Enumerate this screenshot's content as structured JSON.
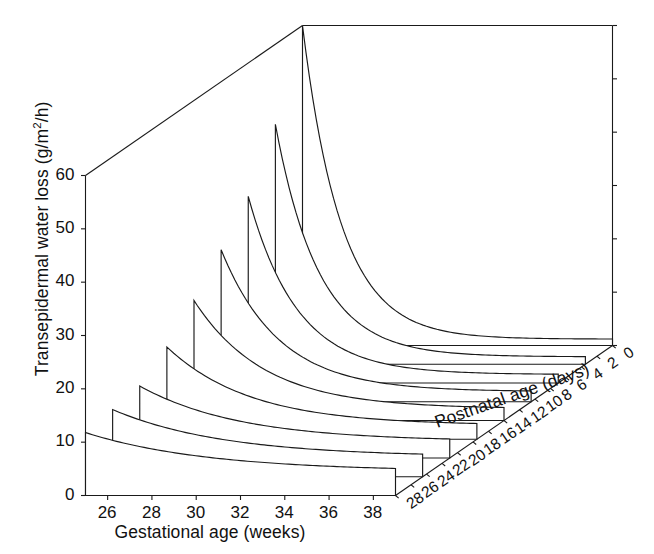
{
  "chart_data": {
    "type": "line",
    "subtype": "3d-waterfall-ridge",
    "title": "",
    "xlabel": "Gestational age (weeks)",
    "ylabel": "Transepidermal water loss (g/m2/h)",
    "zlabel": "Postnatal age (days)",
    "xlabel_display": "Gestational age (weeks)",
    "ylabel_display_pre": "Transepidermal water loss (g/m",
    "ylabel_display_sup": "2",
    "ylabel_display_post": "/h)",
    "zlabel_display": "Postnatal age (days)",
    "xticks": [
      26,
      28,
      30,
      32,
      34,
      36,
      38
    ],
    "xtick_labels": [
      "26",
      "28",
      "30",
      "32",
      "34",
      "36",
      "38"
    ],
    "yticks": [
      0,
      10,
      20,
      30,
      40,
      50,
      60
    ],
    "ytick_labels": [
      "0",
      "10",
      "20",
      "30",
      "40",
      "50",
      "60"
    ],
    "zticks": [
      28,
      26,
      24,
      22,
      20,
      18,
      16,
      14,
      12,
      10,
      8,
      6,
      4,
      2,
      0
    ],
    "ztick_labels": [
      "28",
      "26",
      "24",
      "22",
      "20",
      "18",
      "16",
      "14",
      "12",
      "10",
      "8",
      "6",
      "4",
      "2",
      "0"
    ],
    "xlim": [
      25,
      39
    ],
    "ylim": [
      0,
      60
    ],
    "zlim": [
      0,
      28
    ],
    "grid": false,
    "legend": false,
    "line_color": "#1a1a1a",
    "background_color": "#ffffff",
    "series": [
      {
        "name": "25 weeks",
        "gestational_age": 25,
        "peak_value": 11.8,
        "decay_days": 11.0,
        "asymptote": 4.5,
        "x_days": [
          0,
          2,
          4,
          6,
          8,
          10,
          12,
          14,
          16,
          18,
          20,
          22,
          24,
          26,
          28
        ],
        "values": [
          11.8,
          10.6,
          9.6,
          8.8,
          8.0,
          7.4,
          6.9,
          6.5,
          6.1,
          5.8,
          5.6,
          5.4,
          5.2,
          5.0,
          4.9
        ]
      },
      {
        "name": "27 weeks",
        "gestational_age": 27,
        "peak_value": 12.6,
        "decay_days": 10.0,
        "asymptote": 3.7,
        "x_days": [
          0,
          2,
          4,
          6,
          8,
          10,
          12,
          14,
          16,
          18,
          20,
          22,
          24,
          26,
          28
        ],
        "values": [
          12.6,
          11.2,
          10.0,
          9.0,
          8.2,
          7.5,
          6.9,
          6.4,
          6.0,
          5.7,
          5.4,
          5.2,
          5.0,
          4.8,
          4.7
        ]
      },
      {
        "name": "29 weeks",
        "gestational_age": 29,
        "peak_value": 13.5,
        "decay_days": 9.0,
        "asymptote": 3.1,
        "x_days": [
          0,
          2,
          4,
          6,
          8,
          10,
          12,
          14,
          16,
          18,
          20,
          22,
          24,
          26,
          28
        ],
        "values": [
          13.5,
          11.8,
          10.4,
          9.2,
          8.3,
          7.5,
          6.9,
          6.3,
          5.9,
          5.5,
          5.2,
          5.0,
          4.8,
          4.6,
          4.5
        ]
      },
      {
        "name": "31 weeks",
        "gestational_age": 31,
        "peak_value": 17.3,
        "decay_days": 7.5,
        "asymptote": 2.6,
        "x_days": [
          0,
          2,
          4,
          6,
          8,
          10,
          12,
          14,
          16,
          18,
          20,
          22,
          24,
          26,
          28
        ],
        "values": [
          17.3,
          14.0,
          11.6,
          9.7,
          8.3,
          7.2,
          6.4,
          5.8,
          5.3,
          4.9,
          4.6,
          4.3,
          4.1,
          4.0,
          3.8
        ]
      },
      {
        "name": "33 weeks",
        "gestational_age": 33,
        "peak_value": 22.5,
        "decay_days": 6.3,
        "asymptote": 2.2,
        "x_days": [
          0,
          2,
          4,
          6,
          8,
          10,
          12,
          14,
          16,
          18,
          20,
          22,
          24,
          26,
          28
        ],
        "values": [
          22.5,
          17.0,
          13.1,
          10.4,
          8.5,
          7.1,
          6.1,
          5.4,
          4.9,
          4.4,
          4.1,
          3.9,
          3.7,
          3.5,
          3.4
        ]
      },
      {
        "name": "35 weeks",
        "gestational_age": 35,
        "peak_value": 28.5,
        "decay_days": 5.2,
        "asymptote": 1.9,
        "x_days": [
          0,
          2,
          4,
          6,
          8,
          10,
          12,
          14,
          16,
          18,
          20,
          22,
          24,
          26,
          28
        ],
        "values": [
          28.5,
          20.1,
          14.4,
          10.6,
          8.0,
          6.3,
          5.1,
          4.3,
          3.7,
          3.3,
          3.0,
          2.8,
          2.6,
          2.5,
          2.4
        ]
      },
      {
        "name": "37 weeks",
        "gestational_age": 37,
        "peak_value": 35.0,
        "decay_days": 4.4,
        "asymptote": 1.6,
        "x_days": [
          0,
          2,
          4,
          6,
          8,
          10,
          12,
          14,
          16,
          18,
          20,
          22,
          24,
          26,
          28
        ],
        "values": [
          35.0,
          22.8,
          15.1,
          10.3,
          7.3,
          5.4,
          4.2,
          3.4,
          2.9,
          2.5,
          2.3,
          2.1,
          2.0,
          1.9,
          1.8
        ]
      },
      {
        "name": "39 weeks",
        "gestational_age": 39,
        "peak_value": 45.0,
        "decay_days": 3.9,
        "asymptote": 1.4,
        "x_days": [
          0,
          2,
          4,
          6,
          8,
          10,
          12,
          14,
          16,
          18,
          20,
          22,
          24,
          26,
          28
        ],
        "values": [
          45.0,
          27.1,
          16.5,
          10.4,
          6.8,
          4.7,
          3.4,
          2.6,
          2.1,
          1.8,
          1.7,
          1.6,
          1.5,
          1.5,
          1.4
        ]
      },
      {
        "name": "41 weeks",
        "gestational_age": 41,
        "peak_value": 60.0,
        "decay_days": 3.5,
        "asymptote": 1.2,
        "x_days": [
          0,
          2,
          4,
          6,
          8,
          10,
          12,
          14,
          16,
          18,
          20,
          22,
          24,
          26,
          28
        ],
        "values": [
          60.0,
          34.4,
          19.7,
          11.5,
          7.0,
          4.5,
          3.1,
          2.3,
          1.8,
          1.5,
          1.4,
          1.3,
          1.3,
          1.2,
          1.2
        ]
      }
    ]
  }
}
